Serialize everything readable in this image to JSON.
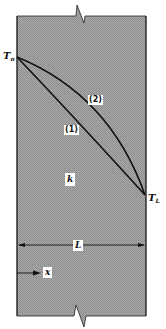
{
  "figure": {
    "colors": {
      "wall_fill": "#9c9c9c",
      "line": "#111111",
      "label_bg": "#ffffff",
      "background": "#ffffff"
    },
    "labels": {
      "t_o_main": "T",
      "t_o_sub": "o",
      "t_l_main": "T",
      "t_l_sub": "L",
      "curve1": "(1)",
      "curve2": "(2)",
      "conductivity": "k",
      "thickness": "L",
      "coordinate": "x"
    },
    "wall": {
      "left": 17,
      "right": 146,
      "top": 16,
      "bottom": 316
    },
    "profiles": [
      {
        "name": "(1)",
        "shape": "near-linear",
        "start": [
          17,
          57
        ],
        "end": [
          145,
          195
        ]
      },
      {
        "name": "(2)",
        "shape": "convex (bulging upward)",
        "start": [
          17,
          57
        ],
        "end": [
          145,
          195
        ]
      }
    ]
  }
}
